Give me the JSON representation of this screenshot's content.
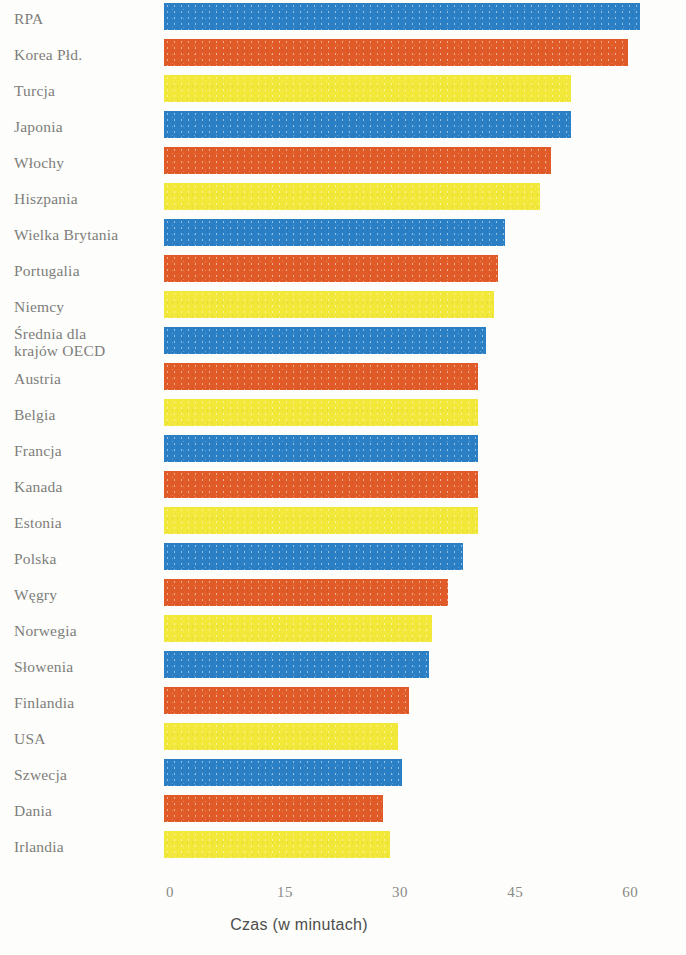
{
  "chart_data": {
    "type": "bar",
    "orientation": "horizontal",
    "title": "",
    "subtitle": "",
    "xlabel": "Czas (w minutach)",
    "ylabel": "",
    "xlim": [
      0,
      65
    ],
    "xticks": [
      0,
      15,
      30,
      45,
      60
    ],
    "xtick_labels": [
      "0",
      "15",
      "30",
      "45",
      "60"
    ],
    "grid": false,
    "legend": "none",
    "categories": [
      "RPA",
      "Korea Płd.",
      "Turcja",
      "Japonia",
      "Włochy",
      "Hiszpania",
      "Wielka Brytania",
      "Portugalia",
      "Niemcy",
      "Średnia dla\nkrajów OECD",
      "Austria",
      "Belgia",
      "Francja",
      "Kanada",
      "Estonia",
      "Polska",
      "Węgry",
      "Norwegia",
      "Słowenia",
      "Finlandia",
      "USA",
      "Szwecja",
      "Dania",
      "Irlandia"
    ],
    "values": [
      62,
      60.5,
      53,
      53,
      50.5,
      49,
      44.5,
      43.5,
      43,
      42,
      41,
      41,
      41,
      41,
      41,
      39,
      37,
      35,
      34.5,
      32,
      30.5,
      31,
      28.5,
      29.5
    ],
    "bar_colors": [
      "#2b7fc4",
      "#e05b28",
      "#f2e839",
      "#2b7fc4",
      "#e05b28",
      "#f2e839",
      "#2b7fc4",
      "#e05b28",
      "#f2e839",
      "#2b7fc4",
      "#e05b28",
      "#f2e839",
      "#2b7fc4",
      "#e05b28",
      "#f2e839",
      "#2b7fc4",
      "#e05b28",
      "#f2e839",
      "#2b7fc4",
      "#e05b28",
      "#f2e839",
      "#2b7fc4",
      "#e05b28",
      "#f2e839"
    ],
    "color_names": [
      "blue",
      "orange",
      "yellow",
      "blue",
      "orange",
      "yellow",
      "blue",
      "orange",
      "yellow",
      "blue",
      "orange",
      "yellow",
      "blue",
      "orange",
      "yellow",
      "blue",
      "orange",
      "yellow",
      "blue",
      "orange",
      "yellow",
      "blue",
      "orange",
      "yellow"
    ],
    "palette": {
      "blue": "#2b7fc4",
      "orange": "#e05b28",
      "yellow": "#f2e839",
      "background": "#fdfdfc",
      "label_text": "#7d7d7a",
      "axis_text": "#8a8a86",
      "axis_title_text": "#4d4d4b"
    }
  }
}
